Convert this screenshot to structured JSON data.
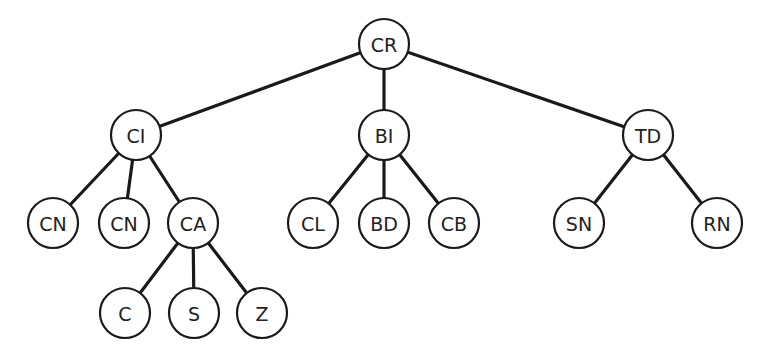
{
  "diagram": {
    "type": "tree",
    "nodes": [
      {
        "id": "cr",
        "label": "CR",
        "x": 384,
        "y": 44
      },
      {
        "id": "ci",
        "label": "CI",
        "x": 136,
        "y": 135
      },
      {
        "id": "bi",
        "label": "BI",
        "x": 384,
        "y": 135
      },
      {
        "id": "td",
        "label": "TD",
        "x": 648,
        "y": 135
      },
      {
        "id": "cn1",
        "label": "CN",
        "x": 53,
        "y": 223
      },
      {
        "id": "cn2",
        "label": "CN",
        "x": 124,
        "y": 223
      },
      {
        "id": "ca",
        "label": "CA",
        "x": 193,
        "y": 223
      },
      {
        "id": "cl",
        "label": "CL",
        "x": 313,
        "y": 223
      },
      {
        "id": "bd",
        "label": "BD",
        "x": 384,
        "y": 223
      },
      {
        "id": "cb",
        "label": "CB",
        "x": 454,
        "y": 223
      },
      {
        "id": "sn",
        "label": "SN",
        "x": 579,
        "y": 223
      },
      {
        "id": "rn",
        "label": "RN",
        "x": 717,
        "y": 223
      },
      {
        "id": "c",
        "label": "C",
        "x": 125,
        "y": 313
      },
      {
        "id": "s",
        "label": "S",
        "x": 194,
        "y": 313
      },
      {
        "id": "z",
        "label": "Z",
        "x": 262,
        "y": 313
      }
    ],
    "edges": [
      [
        "cr",
        "ci"
      ],
      [
        "cr",
        "bi"
      ],
      [
        "cr",
        "td"
      ],
      [
        "ci",
        "cn1"
      ],
      [
        "ci",
        "cn2"
      ],
      [
        "ci",
        "ca"
      ],
      [
        "bi",
        "cl"
      ],
      [
        "bi",
        "bd"
      ],
      [
        "bi",
        "cb"
      ],
      [
        "td",
        "sn"
      ],
      [
        "td",
        "rn"
      ],
      [
        "ca",
        "c"
      ],
      [
        "ca",
        "s"
      ],
      [
        "ca",
        "z"
      ]
    ],
    "node_radius": 25
  }
}
